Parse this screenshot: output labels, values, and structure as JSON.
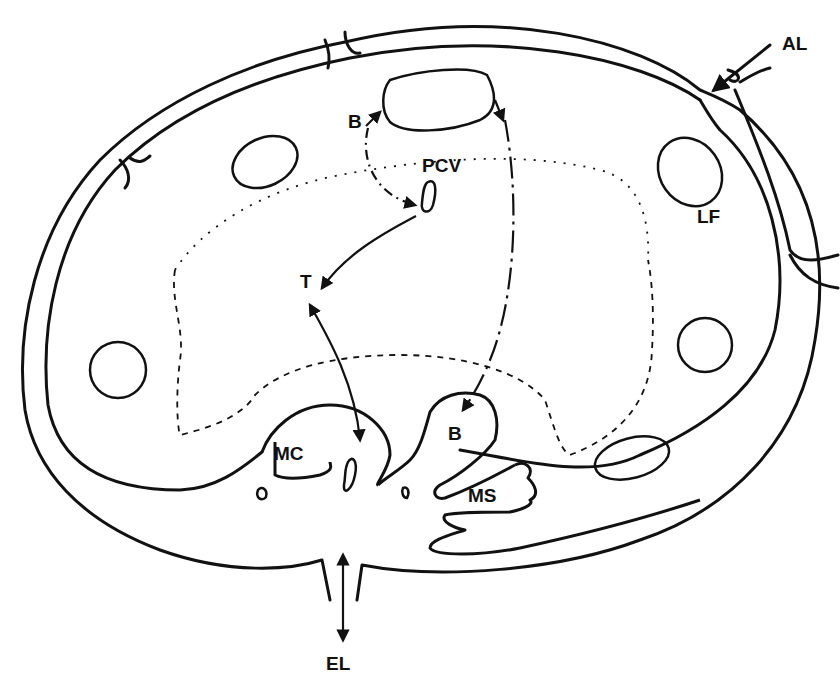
{
  "diagram": {
    "type": "lymph node schematic (cross-section)",
    "colors": {
      "ink": "#111111",
      "background": "#ffffff"
    },
    "labels": {
      "al": "AL",
      "lf": "LF",
      "b_top": "B",
      "pcv": "PCV",
      "t": "T",
      "mc": "MC",
      "b_bottom": "B",
      "ms": "MS",
      "el": "EL"
    },
    "pathways": [
      {
        "name": "B-cell path",
        "from": "B (follicle)",
        "to": "PCV",
        "style": "dash-dot"
      },
      {
        "name": "T-cell path",
        "from": "PCV",
        "to": "T",
        "style": "solid"
      },
      {
        "name": "T to medullary cord",
        "from": "T",
        "to": "MC",
        "style": "solid"
      },
      {
        "name": "B-cell exit path",
        "from": "follicle",
        "to": "B (medulla)",
        "style": "long dash-dot"
      },
      {
        "name": "afferent flow",
        "from": "AL",
        "to": "subcapsular sinus",
        "style": "solid"
      },
      {
        "name": "efferent flow",
        "from": "hilum",
        "to": "EL",
        "style": "solid"
      }
    ]
  }
}
